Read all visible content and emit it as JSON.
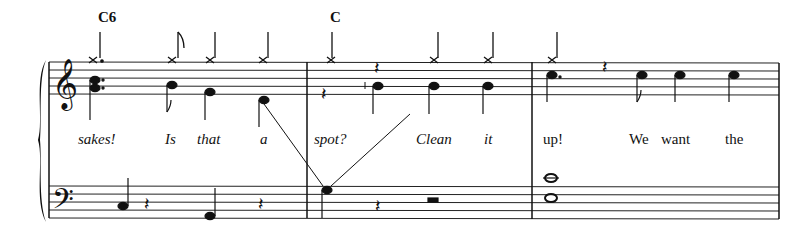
{
  "score": {
    "chords": [
      {
        "label": "C6",
        "x": 98
      },
      {
        "label": "C",
        "x": 330
      }
    ],
    "lyrics": [
      {
        "text": "sakes!",
        "x": 78,
        "italic": true
      },
      {
        "text": "Is",
        "x": 165,
        "italic": true
      },
      {
        "text": "that",
        "x": 197,
        "italic": true
      },
      {
        "text": "a",
        "x": 260,
        "italic": true
      },
      {
        "text": "spot?",
        "x": 314,
        "italic": true
      },
      {
        "text": "Clean",
        "x": 416,
        "italic": true
      },
      {
        "text": "it",
        "x": 484,
        "italic": true
      },
      {
        "text": "up!",
        "x": 543,
        "italic": false
      },
      {
        "text": "We",
        "x": 629,
        "italic": false
      },
      {
        "text": "want",
        "x": 661,
        "italic": false
      },
      {
        "text": "the",
        "x": 725,
        "italic": false
      }
    ],
    "measures": 3,
    "clefs": [
      "treble",
      "bass"
    ]
  }
}
